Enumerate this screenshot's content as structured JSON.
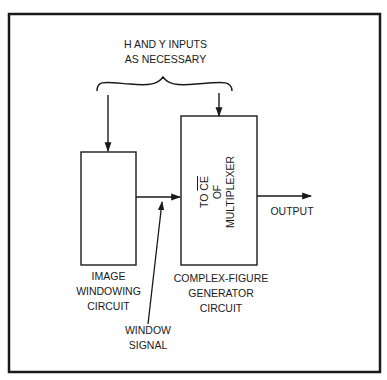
{
  "diagram": {
    "colors": {
      "ink": "#1a1a1a",
      "background": "#ffffff"
    },
    "top_label": {
      "line1": "H AND Y INPUTS",
      "line2": "AS NECESSARY"
    },
    "left_block": {
      "label_line1": "IMAGE",
      "label_line2": "WINDOWING",
      "label_line3": "CIRCUIT"
    },
    "right_block": {
      "inner_line1_prefix": "TO ",
      "inner_line1_overlined": "CE",
      "inner_line2": "OF",
      "inner_line3": "MULTIPLEXER",
      "label_line1": "COMPLEX-FIGURE",
      "label_line2": "GENERATOR",
      "label_line3": "CIRCUIT"
    },
    "output_label": "OUTPUT",
    "window_signal": {
      "line1": "WINDOW",
      "line2": "SIGNAL"
    },
    "connections": [
      {
        "from": "h-and-y-inputs",
        "to": "image-windowing-circuit"
      },
      {
        "from": "h-and-y-inputs",
        "to": "complex-figure-generator-circuit"
      },
      {
        "from": "image-windowing-circuit",
        "to": "complex-figure-generator-circuit",
        "label": "WINDOW SIGNAL"
      },
      {
        "from": "complex-figure-generator-circuit",
        "to": "output"
      }
    ]
  }
}
